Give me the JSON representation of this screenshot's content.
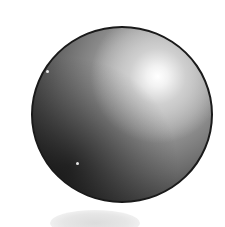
{
  "illustration": {
    "subject": "shaded sphere",
    "sphere": {
      "fill_dark": "#1c1c1c",
      "fill_mid": "#9a9a9a",
      "highlight": "#ffffff",
      "outline": "#1a1a1a"
    },
    "shadow": {
      "color": "#dcdcdc"
    },
    "background": "#ffffff"
  }
}
